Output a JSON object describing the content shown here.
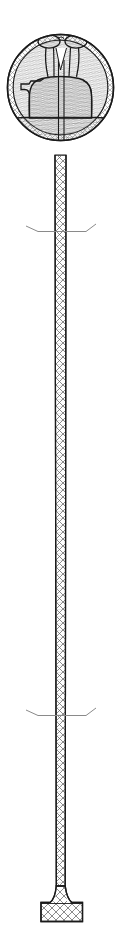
{
  "figure": {
    "title": "Sectional line drawing: hatched spherical head on slender trussed shaft with flared base",
    "type": "technical-cross-section-illustration",
    "canvas": {
      "width": 121,
      "height": 938,
      "background": "#ffffff"
    }
  },
  "style": {
    "outline_color": "#1a1a1a",
    "hatch_color": "#6e6e6e",
    "light_hatch_color": "#9a9a9a",
    "truss_color": "#555555",
    "break_line_color": "#8a8a8a",
    "fill_color": "#ffffff",
    "outline_width": 1.4,
    "hatch_width": 0.5
  },
  "parts": [
    {
      "name": "spherical-head",
      "label": "Head (circular section)",
      "shape": "circle",
      "cx": 60.5,
      "cy": 87.5,
      "r": 53.5,
      "hatch": "wavy-dense",
      "rim_hatch": "cross-hatch-band",
      "rim_thickness": 6
    },
    {
      "name": "rim-band",
      "label": "Outer rim / cortex band",
      "hatch": "diagonal-cross",
      "inner_r": 47.5
    },
    {
      "name": "twin-cap-left",
      "label": "Left rounded cap lobe",
      "shape": "ellipse",
      "cx": 50,
      "cy": 42,
      "rx": 10.5,
      "ry": 6.5
    },
    {
      "name": "twin-cap-right",
      "label": "Right rounded cap lobe",
      "shape": "ellipse",
      "cx": 76,
      "cy": 42,
      "rx": 10.5,
      "ry": 6.5
    },
    {
      "name": "central-stalk-pair",
      "label": "Paired central stalks descending from caps",
      "top_y": 44,
      "bottom_y": 78
    },
    {
      "name": "upper-body-mass",
      "label": "Upper rounded body mass",
      "top_y": 70,
      "bottom_y": 118,
      "left_x": 30,
      "right_x": 92
    },
    {
      "name": "left-notch",
      "label": "Left step notch in body outline",
      "x": 24,
      "y": 79
    },
    {
      "name": "lower-basal-mass",
      "label": "Lower basal mass / floor segment",
      "top_y": 118,
      "bottom_y": 158
    },
    {
      "name": "shaft",
      "label": "Slender trussed shaft",
      "top_y": 155,
      "bottom_y": 886,
      "top_width": 11,
      "bottom_width": 8.5,
      "lattice": "zigzag-x-truss"
    },
    {
      "name": "break-line-upper",
      "label": "Upper break symbol",
      "y": 229,
      "x_from": 26,
      "x_to": 96
    },
    {
      "name": "break-line-lower",
      "label": "Lower break symbol",
      "y": 713,
      "x_from": 26,
      "x_to": 96
    },
    {
      "name": "base-foot",
      "label": "Flared base foot",
      "top_y": 886,
      "bottom_y": 922,
      "width": 41,
      "cx": 62
    }
  ],
  "annotations": {
    "break_symbol_count": 2,
    "shaft_segments": 3,
    "visible_text": ""
  }
}
